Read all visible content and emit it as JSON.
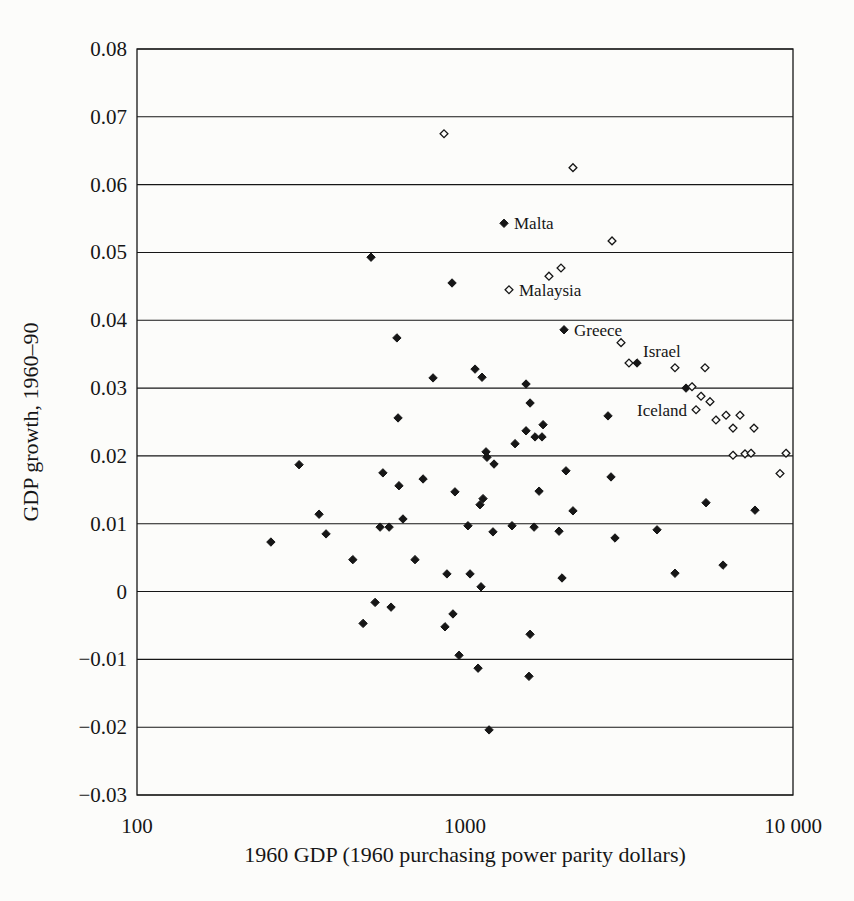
{
  "figure": {
    "background": "#fcfcfa",
    "ink_color": "#161616"
  },
  "chart_data": {
    "type": "scatter",
    "title": "",
    "xlabel": "1960 GDP (1960 purchasing power parity dollars)",
    "ylabel": "GDP growth, 1960–90",
    "x_scale": "log",
    "xlim": [
      100,
      10000
    ],
    "ylim": [
      -0.03,
      0.08
    ],
    "grid": "horizontal",
    "legend": "none",
    "x_ticks": [
      {
        "value": 100,
        "label": "100"
      },
      {
        "value": 1000,
        "label": "1000"
      },
      {
        "value": 10000,
        "label": "10 000"
      }
    ],
    "y_ticks": [
      {
        "value": 0.08,
        "label": "0.08"
      },
      {
        "value": 0.07,
        "label": "0.07"
      },
      {
        "value": 0.06,
        "label": "0.06"
      },
      {
        "value": 0.05,
        "label": "0.05"
      },
      {
        "value": 0.04,
        "label": "0.04"
      },
      {
        "value": 0.03,
        "label": "0.03"
      },
      {
        "value": 0.02,
        "label": "0.02"
      },
      {
        "value": 0.01,
        "label": "0.01"
      },
      {
        "value": 0,
        "label": "0"
      },
      {
        "value": -0.01,
        "label": "−0.01"
      },
      {
        "value": -0.02,
        "label": "−0.02"
      },
      {
        "value": -0.03,
        "label": "−0.03"
      }
    ],
    "series": [
      {
        "name": "filled-diamond-countries",
        "marker": "filled_diamond",
        "color": "#161616",
        "points": [
          [
            517,
            0.0493
          ],
          [
            913,
            0.0455
          ],
          [
            1315,
            0.0543
          ],
          [
            620,
            0.0374
          ],
          [
            625,
            0.0256
          ],
          [
            2004,
            0.0386
          ],
          [
            799,
            0.0315
          ],
          [
            1073,
            0.0328
          ],
          [
            1127,
            0.0316
          ],
          [
            1535,
            0.0306
          ],
          [
            1579,
            0.0278
          ],
          [
            2729,
            0.0259
          ],
          [
            1730,
            0.0246
          ],
          [
            1535,
            0.0237
          ],
          [
            1635,
            0.0228
          ],
          [
            1717,
            0.0228
          ],
          [
            1421,
            0.0218
          ],
          [
            1159,
            0.0206
          ],
          [
            1167,
            0.0198
          ],
          [
            1226,
            0.0188
          ],
          [
            312,
            0.0187
          ],
          [
            562,
            0.0175
          ],
          [
            745,
            0.0166
          ],
          [
            629,
            0.0156
          ],
          [
            2032,
            0.0178
          ],
          [
            2787,
            0.0169
          ],
          [
            932,
            0.0147
          ],
          [
            1682,
            0.0148
          ],
          [
            1135,
            0.0137
          ],
          [
            1111,
            0.0128
          ],
          [
            2134,
            0.0119
          ],
          [
            5430,
            0.0131
          ],
          [
            7658,
            0.012
          ],
          [
            359,
            0.0114
          ],
          [
            647,
            0.0107
          ],
          [
            551,
            0.0095
          ],
          [
            587,
            0.0095
          ],
          [
            1021,
            0.0097
          ],
          [
            1217,
            0.0088
          ],
          [
            1391,
            0.0097
          ],
          [
            1624,
            0.0095
          ],
          [
            1935,
            0.0089
          ],
          [
            2866,
            0.0079
          ],
          [
            3850,
            0.0091
          ],
          [
            377,
            0.0085
          ],
          [
            256,
            0.0073
          ],
          [
            455,
            0.0047
          ],
          [
            704,
            0.0047
          ],
          [
            6119,
            0.0039
          ],
          [
            881,
            0.0026
          ],
          [
            1036,
            0.0026
          ],
          [
            4367,
            0.0027
          ],
          [
            1976,
            0.002
          ],
          [
            1119,
            0.0007
          ],
          [
            532,
            -0.0016
          ],
          [
            595,
            -0.0023
          ],
          [
            489,
            -0.0047
          ],
          [
            919,
            -0.0033
          ],
          [
            869,
            -0.0052
          ],
          [
            1579,
            -0.0063
          ],
          [
            959,
            -0.0094
          ],
          [
            1096,
            -0.0113
          ],
          [
            1567,
            -0.0125
          ],
          [
            1184,
            -0.0204
          ],
          [
            4719,
            0.03
          ],
          [
            3346,
            0.0337
          ]
        ]
      },
      {
        "name": "open-diamond-countries",
        "marker": "open_diamond",
        "color": "#161616",
        "points": [
          [
            863,
            0.0675
          ],
          [
            2134,
            0.0625
          ],
          [
            2807,
            0.0517
          ],
          [
            1962,
            0.0477
          ],
          [
            1803,
            0.0465
          ],
          [
            1362,
            0.0445
          ],
          [
            2990,
            0.0367
          ],
          [
            3162,
            0.0337
          ],
          [
            4367,
            0.033
          ],
          [
            5392,
            0.033
          ],
          [
            4921,
            0.0302
          ],
          [
            5243,
            0.0288
          ],
          [
            5584,
            0.028
          ],
          [
            5063,
            0.0268
          ],
          [
            5823,
            0.0253
          ],
          [
            6249,
            0.026
          ],
          [
            6893,
            0.026
          ],
          [
            6563,
            0.0241
          ],
          [
            7605,
            0.0241
          ],
          [
            6563,
            0.0201
          ],
          [
            7140,
            0.0203
          ],
          [
            7447,
            0.0204
          ],
          [
            9521,
            0.0204
          ],
          [
            9128,
            0.0174
          ]
        ]
      }
    ],
    "annotations": [
      {
        "label": "Malta",
        "gdp": 1315,
        "growth": 0.0543,
        "anchor": "start",
        "dx": 10,
        "dy": 1
      },
      {
        "label": "Malaysia",
        "gdp": 1362,
        "growth": 0.0445,
        "anchor": "start",
        "dx": 10,
        "dy": 1
      },
      {
        "label": "Greece",
        "gdp": 2004,
        "growth": 0.0386,
        "anchor": "start",
        "dx": 10,
        "dy": 1
      },
      {
        "label": "Israel",
        "gdp": 3346,
        "growth": 0.0337,
        "anchor": "start",
        "dx": 6,
        "dy": -11
      },
      {
        "label": "Iceland",
        "gdp": 5063,
        "growth": 0.0268,
        "anchor": "end",
        "dx": -9,
        "dy": 1
      }
    ]
  }
}
